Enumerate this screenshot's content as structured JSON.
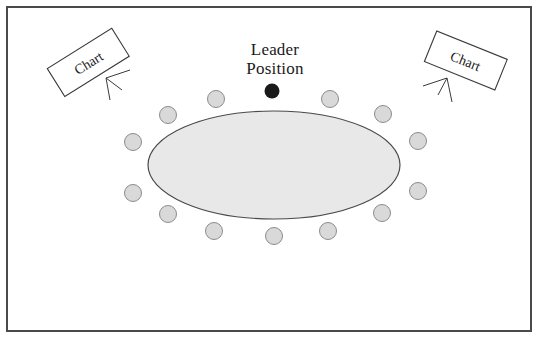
{
  "diagram": {
    "labels": {
      "leader_line1": "Leader",
      "leader_line2": "Position"
    },
    "easels": [
      {
        "id": "easel-left",
        "label": "Chart",
        "rotation_deg": -32,
        "x": 88,
        "y": 62
      },
      {
        "id": "easel-right",
        "label": "Chart",
        "rotation_deg": 22,
        "x": 466,
        "y": 60
      }
    ],
    "table": {
      "shape": "ellipse",
      "cx": 274,
      "cy": 165,
      "rx": 126,
      "ry": 54,
      "fill": "#e8e8e8",
      "stroke": "#4a4a4a"
    },
    "leader_seat": {
      "cx": 272,
      "cy": 91,
      "r": 7.5,
      "fill": "#1a1a1a"
    },
    "seat_style": {
      "r": 8.5,
      "fill": "#d9d9d9",
      "stroke": "#8c8c8c"
    },
    "seats": [
      {
        "cx": 216,
        "cy": 99
      },
      {
        "cx": 330,
        "cy": 99
      },
      {
        "cx": 168,
        "cy": 115
      },
      {
        "cx": 383,
        "cy": 114
      },
      {
        "cx": 133,
        "cy": 142
      },
      {
        "cx": 418,
        "cy": 141
      },
      {
        "cx": 133,
        "cy": 193
      },
      {
        "cx": 418,
        "cy": 191
      },
      {
        "cx": 168,
        "cy": 214
      },
      {
        "cx": 382,
        "cy": 213
      },
      {
        "cx": 214,
        "cy": 231
      },
      {
        "cx": 328,
        "cy": 231
      },
      {
        "cx": 274,
        "cy": 236
      }
    ],
    "counts": {
      "total_seats": 14,
      "leader_seats": 1,
      "member_seats": 13
    },
    "colors": {
      "frame": "#4a4a4a",
      "background": "#ffffff",
      "table_fill": "#e8e8e8",
      "seat_fill": "#d9d9d9",
      "seat_stroke": "#8c8c8c",
      "leader_fill": "#1a1a1a",
      "text": "#1a1a1a"
    }
  }
}
